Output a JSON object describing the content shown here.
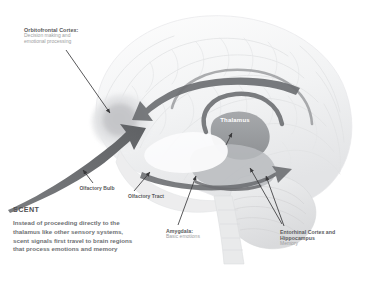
{
  "figure": {
    "background": "#ffffff",
    "arrow_color": "#6d6f72",
    "leader_color": "#3a3a3c",
    "title_color": "#59595b",
    "sub_color": "#9c9ea1"
  },
  "brain": {
    "name": "lateral-brain-illustration",
    "thalamus_label": "Thalamus",
    "thalamus_label_color": "#ffffff"
  },
  "labels": {
    "orbitofrontal": {
      "title": "Orbitofrontal Cortex:",
      "sub": "Decision making and emotional processing"
    },
    "olfactory_bulb": {
      "title": "Olfactory Bulb",
      "sub": ""
    },
    "olfactory_tract": {
      "title": "Olfactory Tract",
      "sub": ""
    },
    "amygdala": {
      "title": "Amygdala:",
      "sub": "Basic emotions"
    },
    "entorhinal": {
      "title": "Entorhinal Cortex and Hippocampus",
      "sub": "Memory"
    }
  },
  "scent": {
    "heading": "SCENT",
    "body": "Instead of proceeding directly to the thalamus like other sensory systems, scent signals first travel to brain regions that process emotions and memory"
  }
}
